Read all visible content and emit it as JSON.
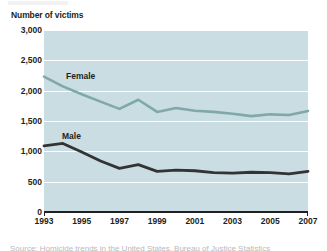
{
  "figure": {
    "axis_title": "Number of victims",
    "caption_partial": "Source: Homicide trends in the United States, Bureau of Justice Statistics"
  },
  "colors": {
    "plot_background": "#cadde3",
    "gridline": "#ffffff",
    "female_line": "#7fa8ab",
    "male_line": "#333333",
    "axis": "#231f20",
    "text": "#231f20",
    "page_background": "#ffffff"
  },
  "chart_data": {
    "type": "line",
    "title": "",
    "subtitle": "",
    "xlabel": "",
    "ylabel": "Number of victims",
    "x": [
      1993,
      1994,
      1995,
      1996,
      1997,
      1998,
      1999,
      2000,
      2001,
      2002,
      2003,
      2004,
      2005,
      2006,
      2007
    ],
    "xtick_labels": [
      "1993",
      "1995",
      "1997",
      "1999",
      "2001",
      "2003",
      "2005",
      "2007"
    ],
    "xtick_values": [
      1993,
      1995,
      1997,
      1999,
      2001,
      2003,
      2005,
      2007
    ],
    "xlim": [
      1993,
      2007
    ],
    "ytick_labels": [
      "0",
      "500",
      "1,000",
      "1,500",
      "2,000",
      "2,500",
      "3,000"
    ],
    "ytick_values": [
      0,
      500,
      1000,
      1500,
      2000,
      2500,
      3000
    ],
    "ylim": [
      0,
      3000
    ],
    "grid": true,
    "grid_orientation": "horizontal",
    "legend": "inline-labels",
    "series": [
      {
        "name": "Female",
        "color": "#7fa8ab",
        "label_position": "inline",
        "values": [
          2230,
          2070,
          1940,
          1820,
          1700,
          1850,
          1650,
          1715,
          1670,
          1650,
          1620,
          1580,
          1610,
          1600,
          1665
        ]
      },
      {
        "name": "Male",
        "color": "#333333",
        "label_position": "inline",
        "values": [
          1090,
          1130,
          990,
          840,
          720,
          780,
          670,
          690,
          680,
          650,
          640,
          655,
          650,
          630,
          670
        ]
      }
    ]
  }
}
